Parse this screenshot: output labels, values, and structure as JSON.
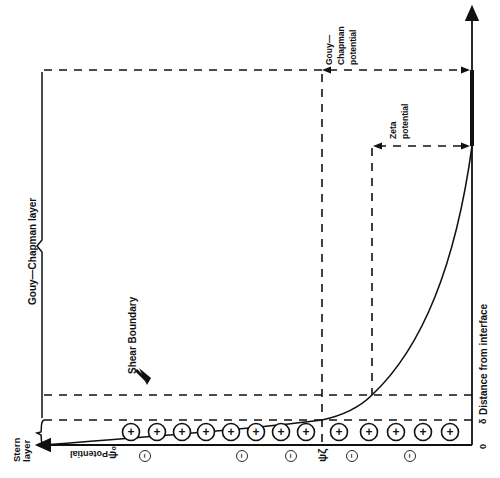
{
  "diagram": {
    "labels": {
      "y_axis": "Distance from interface",
      "x_axis": "Potential",
      "stern_layer": [
        "Stern",
        "layer"
      ],
      "gouy_chapman_layer": "Gouy—Chapman layer",
      "shear_boundary": "Shear Boundary",
      "gouy_chapman_potential": [
        "Gouy—",
        "Chapman",
        "potential"
      ],
      "zeta_potential": [
        "Zeta",
        "potential"
      ],
      "psi_0": "ψ₀",
      "psi_zeta": "ψζ",
      "tick_zero": "0",
      "tick_delta": "δ"
    },
    "positive_ions_count": 13,
    "negative_ions_count": 6,
    "positive_ion_symbol": "+",
    "negative_ion_symbol": "−",
    "colors": {
      "ink": "#111111",
      "background": "#ffffff"
    }
  }
}
